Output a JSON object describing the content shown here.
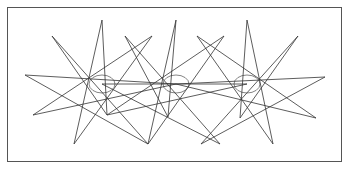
{
  "figure": {
    "stroke_color": "#333333",
    "border_color": "#555555",
    "stars": [
      {
        "center": [
          102,
          84
        ],
        "tips": [
          [
            102,
            20
          ],
          [
            152,
            36
          ],
          [
            176,
            84
          ],
          [
            148,
            144
          ],
          [
            107,
            115
          ],
          [
            74,
            144
          ],
          [
            33,
            115
          ],
          [
            25,
            75
          ],
          [
            52,
            36
          ]
        ]
      },
      {
        "center": [
          176,
          84
        ],
        "tips": [
          [
            176,
            20
          ],
          [
            224,
            36
          ],
          [
            247,
            84
          ],
          [
            220,
            144
          ],
          [
            168,
            117
          ],
          [
            148,
            144
          ],
          [
            107,
            115
          ],
          [
            102,
            84
          ],
          [
            125,
            36
          ]
        ]
      },
      {
        "center": [
          247,
          84
        ],
        "tips": [
          [
            247,
            20
          ],
          [
            298,
            36
          ],
          [
            325,
            77
          ],
          [
            316,
            118
          ],
          [
            273,
            144
          ],
          [
            240,
            118
          ],
          [
            201,
            144
          ],
          [
            176,
            84
          ],
          [
            197,
            36
          ]
        ]
      }
    ]
  }
}
